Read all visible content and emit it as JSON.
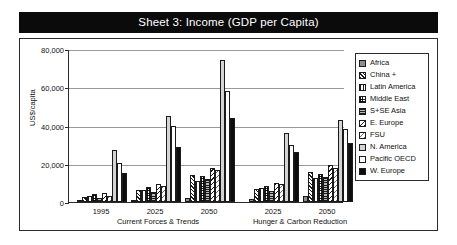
{
  "banner": {
    "title": "Sheet 3: Income (GDP per Capita)"
  },
  "chart_data": {
    "type": "bar",
    "title": "Sheet 3: Income (GDP per Capita)",
    "xlabel": "",
    "ylabel": "US$/capita",
    "ylim": [
      0,
      80000
    ],
    "yticks": [
      "0",
      "20,000",
      "40,000",
      "60,000",
      "80,000"
    ],
    "ytick_values": [
      0,
      20000,
      40000,
      60000,
      80000
    ],
    "grid": true,
    "legend_position": "right",
    "categories": [
      "1995",
      "2025",
      "2050",
      "2025",
      "2050"
    ],
    "scenarios": [
      {
        "name": "Current Forces & Trends",
        "periods": [
          "1995",
          "2025",
          "2050"
        ]
      },
      {
        "name": "Hunger & Carbon Reduction",
        "periods": [
          "2025",
          "2050"
        ]
      }
    ],
    "series": [
      {
        "name": "Africa",
        "pattern": "solid-gray",
        "values": [
          700,
          1200,
          2200,
          1600,
          3200
        ]
      },
      {
        "name": "China +",
        "pattern": "diagonal-dense",
        "values": [
          2600,
          6500,
          14000,
          7000,
          15500
        ]
      },
      {
        "name": "Latin America",
        "pattern": "vertical-lines",
        "values": [
          3400,
          6200,
          11000,
          7200,
          12500
        ]
      },
      {
        "name": "Middle East",
        "pattern": "crosshatch",
        "values": [
          4200,
          7800,
          13500,
          8500,
          14500
        ]
      },
      {
        "name": "S+SE Asia",
        "pattern": "horizontal-lines",
        "values": [
          1900,
          5200,
          12000,
          6000,
          13000
        ]
      },
      {
        "name": "E. Europe",
        "pattern": "diagonal-back",
        "values": [
          4800,
          9500,
          18000,
          10000,
          19500
        ]
      },
      {
        "name": "FSU",
        "pattern": "diagonal-light",
        "values": [
          3100,
          8200,
          16500,
          9200,
          18000
        ]
      },
      {
        "name": "N. America",
        "pattern": "light-gray",
        "values": [
          27000,
          45000,
          74000,
          36000,
          43000
        ]
      },
      {
        "name": "Pacific OECD",
        "pattern": "white",
        "values": [
          20500,
          40000,
          58000,
          30000,
          38000
        ]
      },
      {
        "name": "W. Europe",
        "pattern": "black",
        "values": [
          15000,
          29000,
          44000,
          26000,
          31000
        ]
      }
    ]
  },
  "legend": {
    "items": [
      {
        "label": "Africa"
      },
      {
        "label": "China +"
      },
      {
        "label": "Latin America"
      },
      {
        "label": "Middle East"
      },
      {
        "label": "S+SE Asia"
      },
      {
        "label": "E. Europe"
      },
      {
        "label": "FSU"
      },
      {
        "label": "N. America"
      },
      {
        "label": "Pacific OECD"
      },
      {
        "label": "W. Europe"
      }
    ]
  }
}
